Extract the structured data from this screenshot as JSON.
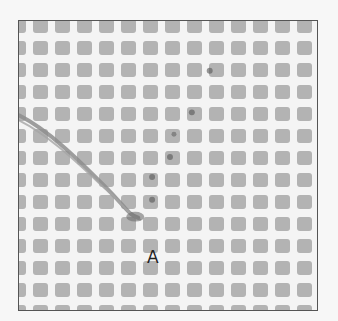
{
  "figure": {
    "label": "A",
    "colors": {
      "background": "#f7f7f7",
      "canvas_mesh": "#f4f4f4",
      "canvas_hole": "#b3b3b3",
      "frame_border": "#555555",
      "yarn": "#8a8a8a",
      "stitch_marks": "#555555"
    },
    "grid": {
      "columns": 14,
      "rows": 14
    }
  }
}
